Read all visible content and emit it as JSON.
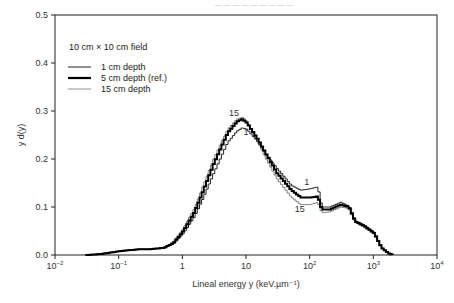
{
  "header": {
    "caption_partial": "— — — — — — — — —"
  },
  "chart_data": {
    "type": "line",
    "title": "",
    "xlabel": "Lineal energy y (keV.µm⁻¹)",
    "ylabel": "y d(y)",
    "xscale": "log",
    "xlim": [
      0.01,
      10000
    ],
    "ylim": [
      0.0,
      0.5
    ],
    "grid": false,
    "legend_position": "upper left",
    "legend_title": "10 cm × 10 cm field",
    "x_ticks": [
      {
        "value": 0.01,
        "base": "10",
        "exp": "−2"
      },
      {
        "value": 0.1,
        "base": "10",
        "exp": "−1"
      },
      {
        "value": 1,
        "base": "1",
        "exp": ""
      },
      {
        "value": 10,
        "base": "10",
        "exp": ""
      },
      {
        "value": 100,
        "base": "10",
        "exp": "2"
      },
      {
        "value": 1000,
        "base": "10",
        "exp": "3"
      },
      {
        "value": 10000,
        "base": "10",
        "exp": "4"
      }
    ],
    "y_ticks": [
      "0.0",
      "0.1",
      "0.2",
      "0.3",
      "0.4",
      "0.5"
    ],
    "x": [
      0.03,
      0.05,
      0.1,
      0.2,
      0.3,
      0.5,
      0.7,
      1,
      1.5,
      2,
      3,
      5,
      7,
      8.5,
      10,
      15,
      20,
      30,
      50,
      70,
      100,
      130,
      150,
      200,
      300,
      400,
      500,
      700,
      1000,
      1300,
      1700,
      2000
    ],
    "series": [
      {
        "name": "1 cm depth",
        "style": "thin",
        "stroke_width": 1,
        "color": "#222222",
        "curve_label": "1",
        "values": [
          0.0,
          0.002,
          0.008,
          0.012,
          0.012,
          0.015,
          0.023,
          0.045,
          0.08,
          0.115,
          0.17,
          0.235,
          0.258,
          0.265,
          0.262,
          0.235,
          0.21,
          0.18,
          0.145,
          0.135,
          0.138,
          0.142,
          0.1,
          0.1,
          0.11,
          0.102,
          0.072,
          0.062,
          0.047,
          0.016,
          0.003,
          0.0
        ]
      },
      {
        "name": "5 cm depth (ref.)",
        "style": "thick",
        "stroke_width": 2,
        "color": "#000000",
        "curve_label": "",
        "values": [
          0.0,
          0.002,
          0.008,
          0.012,
          0.012,
          0.015,
          0.025,
          0.05,
          0.09,
          0.13,
          0.19,
          0.255,
          0.278,
          0.283,
          0.275,
          0.24,
          0.21,
          0.17,
          0.135,
          0.12,
          0.12,
          0.122,
          0.095,
          0.095,
          0.105,
          0.1,
          0.07,
          0.06,
          0.045,
          0.015,
          0.003,
          0.0
        ]
      },
      {
        "name": "15 cm depth",
        "style": "thin-gray",
        "stroke_width": 0.8,
        "color": "#666666",
        "curve_label": "15",
        "values": [
          0.0,
          0.002,
          0.008,
          0.012,
          0.012,
          0.016,
          0.027,
          0.055,
          0.097,
          0.14,
          0.2,
          0.262,
          0.283,
          0.287,
          0.278,
          0.235,
          0.2,
          0.158,
          0.12,
          0.105,
          0.105,
          0.11,
          0.088,
          0.09,
          0.1,
          0.097,
          0.068,
          0.058,
          0.044,
          0.015,
          0.003,
          0.0
        ]
      }
    ],
    "annotations": [
      {
        "text": "15",
        "near_x": 6.5,
        "near_y": 0.29
      },
      {
        "text": "1",
        "near_x": 10,
        "near_y": 0.25
      },
      {
        "text": "1",
        "near_x": 90,
        "near_y": 0.145
      },
      {
        "text": "15",
        "near_x": 70,
        "near_y": 0.09
      }
    ]
  }
}
